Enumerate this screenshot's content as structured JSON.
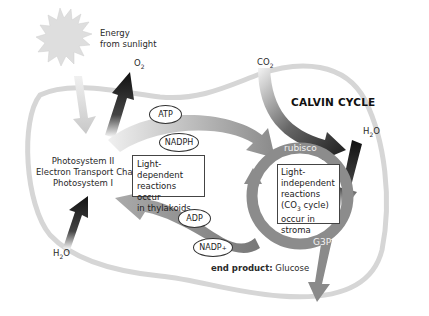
{
  "diagram": {
    "title": "CALVIN CYCLE",
    "sun": {
      "icon": "sun-icon",
      "label_line1": "Energy",
      "label_line2": "from sunlight"
    },
    "inputs_outputs": {
      "o2": {
        "base": "O",
        "sub": "2"
      },
      "co2": {
        "base": "CO",
        "sub": "2"
      },
      "h2o_right": {
        "base": "H",
        "sub": "2",
        "tail": "O"
      },
      "h2o_left": {
        "base": "H",
        "sub": "2",
        "tail": "O"
      }
    },
    "light_reactions": {
      "line1": "Photosystem II",
      "line2": "Electron Transport Chain",
      "line3": "Photosystem I",
      "box_line1": "Light-dependent",
      "box_line2": "reactions occur",
      "box_line3": "in thylakoids"
    },
    "calvin": {
      "box_line1": "Light-",
      "box_line2": "independent",
      "box_line3": "reactions",
      "box_line4_pre": "(CO",
      "box_line4_sub": "3",
      "box_line4_post": " cycle)",
      "box_line5": "occur in stroma",
      "rubisco": "rubisco",
      "g3p": "G3P"
    },
    "molecules": {
      "atp": "ATP",
      "nadph": "NADPH",
      "adp": "ADP",
      "nadp_base": "NADP",
      "nadp_sup": "+"
    },
    "end_product": {
      "label": "end product:",
      "value": " Glucose"
    },
    "colors": {
      "membrane": "#d4d4d4",
      "arrow_light": "#c8c8c8",
      "arrow_mid": "#8a8a8a",
      "arrow_dark": "#1a1a1a",
      "sun": "#dcdcdc"
    }
  }
}
